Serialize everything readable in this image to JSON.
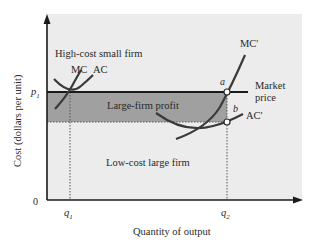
{
  "diagram": {
    "y_axis_label": "Cost (dollars per unit)",
    "x_axis_label": "Quantity of output",
    "origin_label": "0",
    "price_label": "p",
    "price_subscript": "1",
    "q1_label": "q",
    "q1_subscript": "1",
    "q2_label": "q",
    "q2_subscript": "2",
    "small_firm_label": "High-cost small firm",
    "mc_label": "MC",
    "ac_label": "AC",
    "mc_prime_label": "MC'",
    "ac_prime_label": "AC'",
    "profit_label": "Large-firm profit",
    "large_firm_label": "Low-cost large firm",
    "market_price_line1": "Market",
    "market_price_line2": "price",
    "point_a": "a",
    "point_b": "b"
  },
  "colors": {
    "plot_bg": "#ececec",
    "profit_fill": "#a0a0a0",
    "line": "#2a2a2a",
    "curve": "#3a3a3a"
  }
}
